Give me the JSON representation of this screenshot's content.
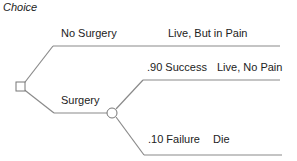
{
  "title": "Choice",
  "branches": {
    "no_surgery": {
      "label": "No Surgery",
      "outcome": "Live, But in Pain"
    },
    "surgery": {
      "label": "Surgery",
      "success": {
        "label": ".90 Success",
        "outcome": "Live, No Pain"
      },
      "failure": {
        "label": ".10 Failure",
        "outcome": "Die"
      }
    }
  },
  "colors": {
    "line": "#888888",
    "text": "#222222"
  }
}
